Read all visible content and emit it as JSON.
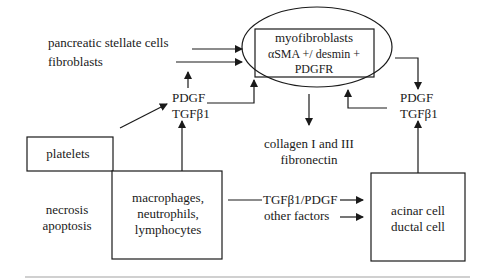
{
  "diagram": {
    "nodes": {
      "myofibroblasts": {
        "lines": [
          "myofibroblasts",
          "αSMA +/ desmin +",
          "PDGFR"
        ]
      },
      "sources": {
        "stellate": "pancreatic stellate cells",
        "fibroblasts": "fibroblasts"
      },
      "growth_factors_left": [
        "PDGF",
        "TGFβ1"
      ],
      "growth_factors_right": [
        "PDGF",
        "TGFβ1"
      ],
      "ecm": [
        "collagen I and III",
        "fibronectin"
      ],
      "platelets": "platelets",
      "injury": [
        "necrosis",
        "apoptosis"
      ],
      "inflammatory": [
        "macrophages,",
        "neutrophils,",
        "lymphocytes"
      ],
      "factors": [
        "TGFβ1/PDGF",
        "other factors"
      ],
      "parenchyma": [
        "acinar cell",
        "ductal cell"
      ]
    },
    "edges": [
      {
        "from": "pancreatic stellate cells",
        "to": "myofibroblasts"
      },
      {
        "from": "fibroblasts",
        "to": "myofibroblasts"
      },
      {
        "from": "PDGF/TGFβ1 (left)",
        "to": "fibroblasts"
      },
      {
        "from": "PDGF/TGFβ1 (left)",
        "to": "myofibroblasts"
      },
      {
        "from": "platelets",
        "to": "PDGF/TGFβ1 (left)"
      },
      {
        "from": "macrophages, neutrophils, lymphocytes",
        "to": "PDGF/TGFβ1 (left)"
      },
      {
        "from": "myofibroblasts",
        "to": "collagen I and III / fibronectin"
      },
      {
        "from": "myofibroblasts",
        "to": "PDGF/TGFβ1 (right)"
      },
      {
        "from": "PDGF/TGFβ1 (right)",
        "to": "myofibroblasts"
      },
      {
        "from": "acinar cell / ductal cell",
        "to": "PDGF/TGFβ1 (right)"
      },
      {
        "from": "macrophages, neutrophils, lymphocytes",
        "to": "acinar cell / ductal cell",
        "label": "TGFβ1/PDGF"
      },
      {
        "from": "other factors",
        "to": "acinar cell / ductal cell"
      }
    ]
  }
}
